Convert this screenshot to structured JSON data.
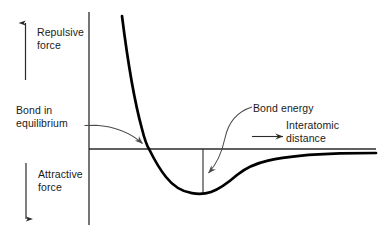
{
  "figure": {
    "labels": {
      "repulsive_force": "Repulsive\nforce",
      "attractive_force": "Attractive\nforce",
      "bond_in_equilibrium": "Bond in\nequilibrium",
      "bond_energy": "Bond energy",
      "interatomic_distance": "Interatomic\ndistance"
    },
    "colors": {
      "curve": "#000000",
      "axis": "#2b2b2b",
      "leader": "#4a4a4a",
      "text": "#1a1a1a",
      "background": "#ffffff"
    }
  },
  "chart_data": {
    "type": "line",
    "title": "",
    "xlabel": "Interatomic distance",
    "ylabel": "Force (Repulsive positive / Attractive negative)",
    "grid": false,
    "legend": null,
    "axis_origin": {
      "x": 89,
      "y": 149
    },
    "xlim": [
      89,
      376
    ],
    "ylim": [
      -1,
      1
    ],
    "annotations": [
      {
        "text": "Bond in equilibrium",
        "points_to": "zero-crossing of the force curve",
        "target_x": 149,
        "target_y": 149
      },
      {
        "text": "Bond energy",
        "points_to": "vertical drop from axis to curve minimum",
        "target_x": 205,
        "target_y": 177
      },
      {
        "text": "Interatomic distance",
        "points_to": "positive x direction along horizontal axis"
      },
      {
        "text": "Repulsive force",
        "points_to": "positive y direction above horizontal axis"
      },
      {
        "text": "Attractive force",
        "points_to": "negative y direction below horizontal axis"
      }
    ],
    "features": {
      "zero_crossing_x": 149,
      "minimum_x": 203,
      "minimum_y": 193,
      "bond_energy_depth_px": 44,
      "asymptote_y": 156
    },
    "x": [
      122,
      126,
      131,
      136,
      141,
      146,
      149,
      155,
      162,
      170,
      178,
      186,
      194,
      203,
      212,
      222,
      232,
      243,
      255,
      268,
      282,
      298,
      316,
      336,
      356,
      376
    ],
    "y": [
      16,
      38,
      62,
      85,
      106,
      128,
      149,
      164,
      175,
      183,
      188,
      191,
      193,
      193.5,
      192,
      187,
      181,
      175,
      170,
      166,
      163,
      160.5,
      158.5,
      157.2,
      156.4,
      156
    ]
  }
}
